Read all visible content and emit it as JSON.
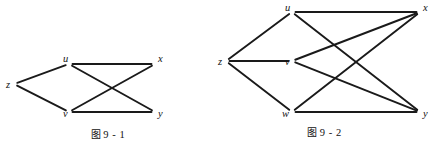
{
  "page": {
    "background": "#ffffff",
    "ink_color": "#1a1a1a",
    "width": 433,
    "height": 151
  },
  "figures": [
    {
      "id": "figure-9-1",
      "caption_cjk": "图",
      "caption_number": "9 - 1",
      "caption_full": "图 9 - 1",
      "graph": {
        "type": "undirected-graph",
        "vertices": [
          {
            "id": "z",
            "label": "z",
            "x": 14,
            "y": 84,
            "label_x": 6,
            "label_y": 88
          },
          {
            "id": "u",
            "label": "u",
            "x": 69,
            "y": 64,
            "label_x": 63,
            "label_y": 62
          },
          {
            "id": "v",
            "label": "v",
            "x": 69,
            "y": 112,
            "label_x": 63,
            "label_y": 117
          },
          {
            "id": "x",
            "label": "x",
            "x": 155,
            "y": 64,
            "label_x": 158,
            "label_y": 62
          },
          {
            "id": "y",
            "label": "y",
            "x": 155,
            "y": 112,
            "label_x": 158,
            "label_y": 117
          }
        ],
        "edges": [
          {
            "from": "z",
            "to": "u"
          },
          {
            "from": "z",
            "to": "v"
          },
          {
            "from": "u",
            "to": "x"
          },
          {
            "from": "u",
            "to": "y"
          },
          {
            "from": "v",
            "to": "x"
          },
          {
            "from": "v",
            "to": "y"
          }
        ]
      }
    },
    {
      "id": "figure-9-2",
      "caption_cjk": "图",
      "caption_number": "9 - 2",
      "caption_full": "图 9 - 2",
      "graph": {
        "type": "undirected-graph",
        "vertices": [
          {
            "id": "z",
            "label": "z",
            "x": 10,
            "y": 61,
            "label_x": 2,
            "label_y": 65
          },
          {
            "id": "u",
            "label": "u",
            "x": 76,
            "y": 12,
            "label_x": 69,
            "label_y": 11
          },
          {
            "id": "v",
            "label": "v",
            "x": 76,
            "y": 61,
            "label_x": 69,
            "label_y": 65
          },
          {
            "id": "w",
            "label": "w",
            "x": 76,
            "y": 112,
            "label_x": 66,
            "label_y": 117
          },
          {
            "id": "x",
            "label": "x",
            "x": 204,
            "y": 12,
            "label_x": 207,
            "label_y": 11
          },
          {
            "id": "y",
            "label": "y",
            "x": 204,
            "y": 112,
            "label_x": 207,
            "label_y": 117
          }
        ],
        "edges": [
          {
            "from": "z",
            "to": "u"
          },
          {
            "from": "z",
            "to": "v"
          },
          {
            "from": "z",
            "to": "w"
          },
          {
            "from": "u",
            "to": "x"
          },
          {
            "from": "u",
            "to": "y"
          },
          {
            "from": "v",
            "to": "x"
          },
          {
            "from": "v",
            "to": "y"
          },
          {
            "from": "w",
            "to": "x"
          },
          {
            "from": "w",
            "to": "y"
          }
        ]
      }
    }
  ]
}
